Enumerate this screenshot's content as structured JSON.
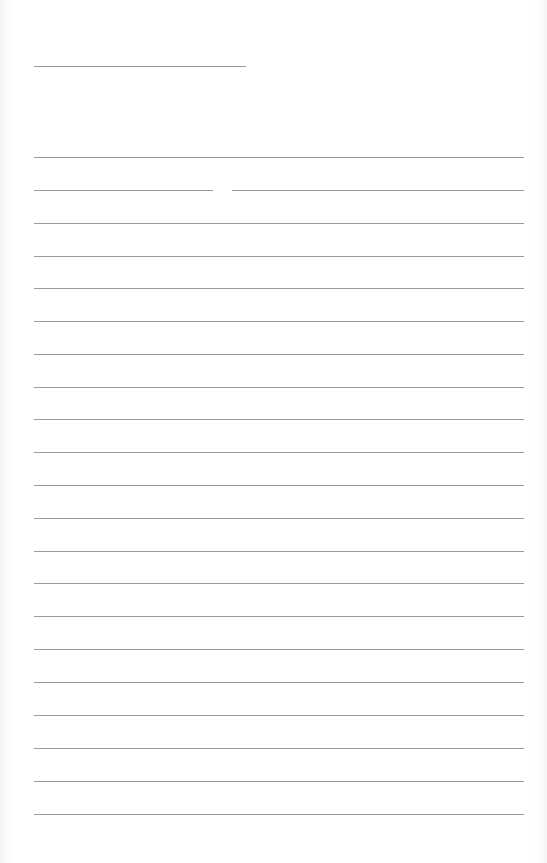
{
  "document": {
    "type": "blank lined form",
    "header_line": {
      "x": 34,
      "y": 66,
      "width": 212
    },
    "lines": [
      {
        "y": 157,
        "segments": [
          [
            34,
            524
          ]
        ]
      },
      {
        "y": 190,
        "segments": [
          [
            34,
            213
          ],
          [
            232,
            524
          ]
        ]
      },
      {
        "y": 223,
        "segments": [
          [
            34,
            524
          ]
        ]
      },
      {
        "y": 256,
        "segments": [
          [
            34,
            524
          ]
        ]
      },
      {
        "y": 288,
        "segments": [
          [
            34,
            524
          ]
        ]
      },
      {
        "y": 321,
        "segments": [
          [
            34,
            524
          ]
        ]
      },
      {
        "y": 354,
        "segments": [
          [
            34,
            524
          ]
        ]
      },
      {
        "y": 387,
        "segments": [
          [
            34,
            524
          ]
        ]
      },
      {
        "y": 419,
        "segments": [
          [
            34,
            524
          ]
        ]
      },
      {
        "y": 452,
        "segments": [
          [
            34,
            524
          ]
        ]
      },
      {
        "y": 485,
        "segments": [
          [
            34,
            524
          ]
        ]
      },
      {
        "y": 518,
        "segments": [
          [
            34,
            524
          ]
        ]
      },
      {
        "y": 551,
        "segments": [
          [
            34,
            524
          ]
        ]
      },
      {
        "y": 583,
        "segments": [
          [
            34,
            524
          ]
        ]
      },
      {
        "y": 616,
        "segments": [
          [
            34,
            524
          ]
        ]
      },
      {
        "y": 649,
        "segments": [
          [
            34,
            524
          ]
        ]
      },
      {
        "y": 682,
        "segments": [
          [
            34,
            524
          ]
        ]
      },
      {
        "y": 715,
        "segments": [
          [
            34,
            524
          ]
        ]
      },
      {
        "y": 748,
        "segments": [
          [
            34,
            524
          ]
        ]
      },
      {
        "y": 781,
        "segments": [
          [
            34,
            524
          ]
        ]
      },
      {
        "y": 814,
        "segments": [
          [
            34,
            524
          ]
        ]
      }
    ],
    "line_color": "#9a9a9a"
  }
}
